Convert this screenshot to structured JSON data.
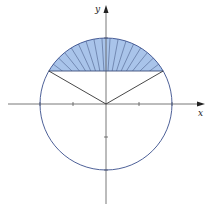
{
  "figure": {
    "width": 216,
    "height": 204,
    "origin": [
      106,
      104
    ],
    "radius": 66,
    "chord_y_fraction_of_radius": 0.5,
    "colors": {
      "circle": "#3a4f8c",
      "axes": "#555555",
      "radii": "#333333",
      "segment_fill": "#a9c4ea",
      "hatch": "#3d4f7a"
    },
    "axes": {
      "x_label": "x",
      "y_label": "y",
      "x_ticks": [
        -1,
        -0.5,
        0.5,
        1
      ],
      "y_ticks": [
        -1,
        -0.5,
        1
      ]
    },
    "hatch_count": 17
  }
}
